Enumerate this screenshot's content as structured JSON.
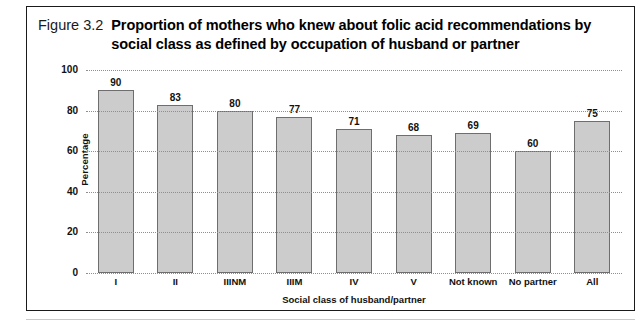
{
  "figure": {
    "number": "Figure 3.2",
    "title": "Proportion of mothers who knew about folic acid recommendations by social class as defined by occupation of husband or partner"
  },
  "chart_data": {
    "type": "bar",
    "title": "Proportion of mothers who knew about folic acid recommendations by social class as defined by occupation of husband or partner",
    "categories": [
      "I",
      "II",
      "IIINM",
      "IIIM",
      "IV",
      "V",
      "Not known",
      "No partner",
      "All"
    ],
    "values": [
      90,
      83,
      80,
      77,
      71,
      68,
      69,
      60,
      75
    ],
    "xlabel": "Social class of husband/partner",
    "ylabel": "Percentage",
    "ylim": [
      0,
      100
    ],
    "yticks": [
      0,
      20,
      40,
      60,
      80,
      100
    ],
    "ytick_labels": [
      "0",
      "20",
      "40",
      "60",
      "80",
      "100"
    ],
    "grid": true,
    "legend": false,
    "bar_color": "#cccccc",
    "bar_border_color": "#6e6e6e",
    "gridline_color": "#8f8f8f"
  }
}
